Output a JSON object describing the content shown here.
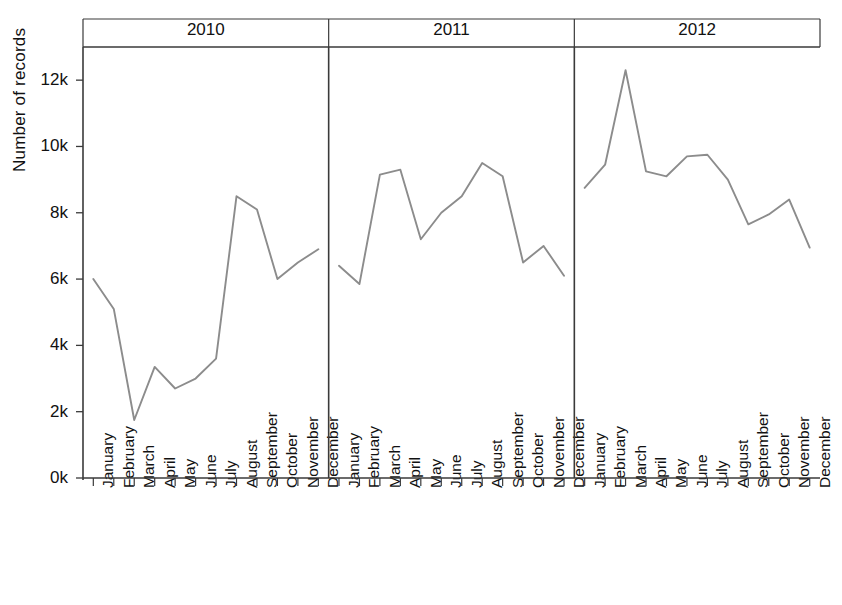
{
  "figure": {
    "width": 842,
    "height": 605,
    "background": "#ffffff",
    "line_color": "#8c8c8c",
    "axis_color": "#3a3a3a",
    "text_color": "#111111"
  },
  "axes": {
    "y_axis_title": "Number of records",
    "y_ticks": [
      "0k",
      "2k",
      "4k",
      "6k",
      "8k",
      "10k",
      "12k"
    ],
    "y_tick_values": [
      0,
      2000,
      4000,
      6000,
      8000,
      10000,
      12000
    ],
    "y_min": 0,
    "y_max": 13000,
    "x_tick_labels": [
      "January",
      "February",
      "March",
      "April",
      "May",
      "June",
      "July",
      "August",
      "September",
      "October",
      "November",
      "December"
    ],
    "panel_strip_labels": [
      "2010",
      "2011",
      "2012"
    ],
    "grid": false,
    "legend": "none"
  },
  "chart_data": {
    "type": "line",
    "title": "",
    "subtitle": "",
    "xlabel": "",
    "ylabel": "Number of records",
    "ylim": [
      0,
      13000
    ],
    "grid": false,
    "legend_position": "none",
    "faceted_by": "year",
    "categories": [
      "January",
      "February",
      "March",
      "April",
      "May",
      "June",
      "July",
      "August",
      "September",
      "October",
      "November",
      "December"
    ],
    "panels": [
      {
        "label": "2010",
        "series": [
          {
            "name": "2010",
            "values": [
              6000,
              5100,
              1750,
              3350,
              2700,
              3000,
              3600,
              8500,
              8100,
              6000,
              6500,
              6900
            ]
          }
        ]
      },
      {
        "label": "2011",
        "series": [
          {
            "name": "2011",
            "values": [
              6400,
              5850,
              9150,
              9300,
              7200,
              8000,
              8500,
              9500,
              9100,
              6500,
              7000,
              6100
            ]
          }
        ]
      },
      {
        "label": "2012",
        "series": [
          {
            "name": "2012",
            "values": [
              8750,
              9450,
              12300,
              9250,
              9100,
              9700,
              9750,
              9000,
              7650,
              7950,
              8400,
              6950
            ]
          }
        ]
      }
    ]
  }
}
